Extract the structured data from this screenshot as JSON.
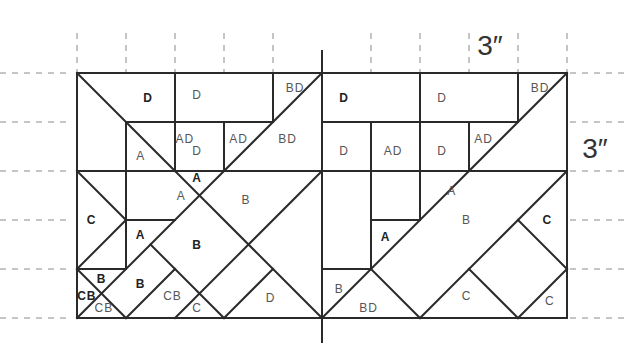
{
  "diagram": {
    "grid": {
      "origin_x": 77,
      "origin_y": 73,
      "unit": 49,
      "cols": 10,
      "rows": 5
    },
    "colors": {
      "line": "#2a2a2a",
      "guide": "#8a8a8a",
      "label": "#555555",
      "label_bold": "#222222"
    },
    "dimensions": [
      {
        "text": "3″",
        "x": 490,
        "y": 45
      },
      {
        "text": "3″",
        "x": 595,
        "y": 148
      }
    ],
    "center_line": {
      "col": 5,
      "y_top": 51,
      "y_bottom": 342
    },
    "guides": {
      "top_cols": [
        0,
        1,
        2,
        3,
        4,
        6,
        7,
        8,
        9,
        10
      ],
      "top_y": [
        33,
        73
      ],
      "left_rows": [
        0,
        1,
        2,
        3,
        4,
        5
      ],
      "left_x": [
        0,
        70
      ],
      "right_rows": [
        0,
        1,
        2,
        3,
        4,
        5
      ],
      "right_x": [
        570,
        625
      ]
    },
    "segments": [
      [
        0,
        0,
        10,
        0
      ],
      [
        0,
        5,
        10,
        5
      ],
      [
        0,
        0,
        0,
        5
      ],
      [
        10,
        0,
        10,
        5
      ],
      [
        0,
        0,
        2,
        2
      ],
      [
        2,
        2,
        5,
        5
      ],
      [
        5,
        0,
        0,
        5
      ],
      [
        2,
        0,
        2,
        2
      ],
      [
        4,
        0,
        4,
        1
      ],
      [
        3,
        1,
        3,
        2
      ],
      [
        1,
        1,
        4,
        1
      ],
      [
        1,
        1,
        1,
        4
      ],
      [
        0,
        2,
        10,
        2
      ],
      [
        0,
        2,
        1,
        3
      ],
      [
        1,
        3,
        0,
        4
      ],
      [
        0,
        4,
        1,
        4
      ],
      [
        0,
        4,
        1,
        5
      ],
      [
        1,
        3,
        2,
        3
      ],
      [
        5,
        2,
        2,
        5
      ],
      [
        1.5,
        3.5,
        3,
        5
      ],
      [
        2,
        4,
        1,
        5
      ],
      [
        4,
        4,
        3,
        5
      ],
      [
        7,
        0,
        7,
        1
      ],
      [
        9,
        0,
        9,
        1
      ],
      [
        5,
        1,
        9,
        1
      ],
      [
        6,
        1,
        6,
        4
      ],
      [
        7,
        1,
        7,
        3
      ],
      [
        8,
        1,
        8,
        2
      ],
      [
        10,
        0,
        5,
        5
      ],
      [
        6,
        3,
        7,
        3
      ],
      [
        5,
        4,
        6,
        4
      ],
      [
        6,
        4,
        7,
        5
      ],
      [
        10,
        2,
        7,
        5
      ],
      [
        9,
        3,
        10,
        4
      ],
      [
        8,
        4,
        9,
        5
      ],
      [
        10,
        4,
        9,
        5
      ]
    ],
    "labels": [
      {
        "text": "D",
        "x": 1.45,
        "y": 0.5,
        "bold": true
      },
      {
        "text": "D",
        "x": 2.45,
        "y": 0.45
      },
      {
        "text": "BD",
        "x": 4.45,
        "y": 0.3
      },
      {
        "text": "AD",
        "x": 2.2,
        "y": 1.35
      },
      {
        "text": "A",
        "x": 1.3,
        "y": 1.7
      },
      {
        "text": "D",
        "x": 2.45,
        "y": 1.6
      },
      {
        "text": "AD",
        "x": 3.3,
        "y": 1.35
      },
      {
        "text": "BD",
        "x": 4.3,
        "y": 1.35
      },
      {
        "text": "A",
        "x": 2.45,
        "y": 2.15,
        "bold": true
      },
      {
        "text": "A",
        "x": 2.13,
        "y": 2.5
      },
      {
        "text": "B",
        "x": 3.45,
        "y": 2.6
      },
      {
        "text": "C",
        "x": 0.3,
        "y": 3.0,
        "bold": true
      },
      {
        "text": "A",
        "x": 1.3,
        "y": 3.3,
        "bold": true
      },
      {
        "text": "B",
        "x": 2.45,
        "y": 3.5,
        "bold": true
      },
      {
        "text": "B",
        "x": 0.5,
        "y": 4.2,
        "bold": true
      },
      {
        "text": "B",
        "x": 1.3,
        "y": 4.3,
        "bold": true
      },
      {
        "text": "CB",
        "x": 0.2,
        "y": 4.55,
        "bold": true
      },
      {
        "text": "CB",
        "x": 0.55,
        "y": 4.8
      },
      {
        "text": "CB",
        "x": 1.95,
        "y": 4.55
      },
      {
        "text": "C",
        "x": 2.45,
        "y": 4.8
      },
      {
        "text": "D",
        "x": 3.95,
        "y": 4.6
      },
      {
        "text": "D",
        "x": 5.45,
        "y": 0.5,
        "bold": true
      },
      {
        "text": "D",
        "x": 7.45,
        "y": 0.5
      },
      {
        "text": "BD",
        "x": 9.45,
        "y": 0.3
      },
      {
        "text": "D",
        "x": 5.45,
        "y": 1.6
      },
      {
        "text": "AD",
        "x": 6.45,
        "y": 1.6
      },
      {
        "text": "D",
        "x": 7.45,
        "y": 1.6
      },
      {
        "text": "AD",
        "x": 8.3,
        "y": 1.35
      },
      {
        "text": "A",
        "x": 7.65,
        "y": 2.4
      },
      {
        "text": "B",
        "x": 7.95,
        "y": 3.0
      },
      {
        "text": "C",
        "x": 9.6,
        "y": 3.0,
        "bold": true
      },
      {
        "text": "A",
        "x": 6.3,
        "y": 3.35,
        "bold": true
      },
      {
        "text": "B",
        "x": 5.35,
        "y": 4.4
      },
      {
        "text": "BD",
        "x": 5.95,
        "y": 4.8
      },
      {
        "text": "C",
        "x": 7.95,
        "y": 4.55
      },
      {
        "text": "C",
        "x": 9.65,
        "y": 4.65
      }
    ]
  }
}
